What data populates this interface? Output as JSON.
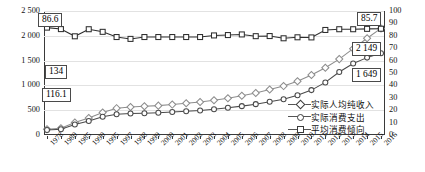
{
  "chart_data": {
    "type": "line",
    "title": "",
    "xlabel": "",
    "ylabel": "",
    "grid": true,
    "legend_position": "inside-bottom-right",
    "categories": [
      "1978",
      "1980",
      "1985",
      "1990",
      "1995",
      "1997",
      "1998",
      "1999",
      "2000",
      "2001",
      "2002",
      "2003",
      "2004",
      "2005",
      "2006",
      "2007",
      "2008",
      "2009",
      "2010",
      "2011",
      "2012",
      "2013",
      "2014",
      "2015",
      "2016"
    ],
    "yaxis_left": {
      "min": 0,
      "max": 2500,
      "step": 500,
      "ticks": [
        "0",
        "500",
        "1 000",
        "1 500",
        "2 000",
        "2 500"
      ]
    },
    "yaxis_right": {
      "min": 0,
      "max": 100,
      "step": 10,
      "ticks": [
        "0",
        "10",
        "20",
        "30",
        "40",
        "50",
        "60",
        "70",
        "80",
        "90",
        "100"
      ]
    },
    "series": [
      {
        "name": "实际人均纯收入",
        "axis": "left",
        "marker": "diamond",
        "values": [
          116.1,
          134,
          253,
          344,
          453,
          541,
          566,
          579,
          592,
          613,
          639,
          665,
          700,
          742,
          790,
          848,
          918,
          986,
          1083,
          1210,
          1356,
          1530,
          1740,
          1950,
          2149
        ]
      },
      {
        "name": "实际消费支出",
        "axis": "left",
        "marker": "circle",
        "values": [
          100,
          116,
          212,
          282,
          368,
          420,
          432,
          440,
          448,
          462,
          478,
          495,
          520,
          548,
          582,
          622,
          672,
          722,
          800,
          905,
          1060,
          1270,
          1440,
          1560,
          1649
        ]
      },
      {
        "name": "平均消费倾向",
        "axis": "right",
        "marker": "square",
        "values": [
          86.6,
          85.4,
          79.6,
          85.3,
          83.2,
          79.0,
          77.5,
          79.0,
          79.0,
          79.0,
          79.0,
          79.0,
          80.3,
          80.6,
          81.1,
          79.7,
          79.8,
          78.0,
          78.8,
          78.7,
          84.7,
          85.3,
          85.3,
          85.6,
          85.7
        ]
      }
    ],
    "annotations": [
      {
        "label": "86.6",
        "series": "平均消费倾向",
        "note": "start value"
      },
      {
        "label": "134",
        "series": "实际人均纯收入",
        "note": "early value"
      },
      {
        "label": "116.1",
        "series": "实际人均纯收入",
        "note": "start value"
      },
      {
        "label": "85.7",
        "series": "平均消费倾向",
        "note": "end value"
      },
      {
        "label": "2 149",
        "series": "实际人均纯收入",
        "note": "end value"
      },
      {
        "label": "1 649",
        "series": "实际消费支出",
        "note": "end value"
      }
    ]
  },
  "legend": {
    "items": [
      {
        "label": "实际人均纯收入",
        "marker": "diamond"
      },
      {
        "label": "实际消费支出",
        "marker": "circle"
      },
      {
        "label": "平均消费倾向",
        "marker": "square"
      }
    ]
  },
  "colors": {
    "axis": "#3a3a3a",
    "grid": "#e2e2e2",
    "series_income": "#8d8d8d",
    "series_consumption": "#4a4a4a",
    "series_propensity": "#2f2f2f",
    "callout_border": "#4a4a4a",
    "background": "#ffffff"
  }
}
